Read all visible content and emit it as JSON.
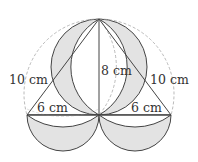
{
  "diagram": {
    "type": "geometry-figure",
    "labels": {
      "left_slant": "10 cm",
      "right_slant": "10 cm",
      "vertical": "8 cm",
      "left_base": "6 cm",
      "right_base": "6 cm"
    },
    "colors": {
      "shade": "#e3e3e3",
      "stroke": "#444444",
      "dashed": "#a8a8a8",
      "background": "#ffffff"
    }
  }
}
